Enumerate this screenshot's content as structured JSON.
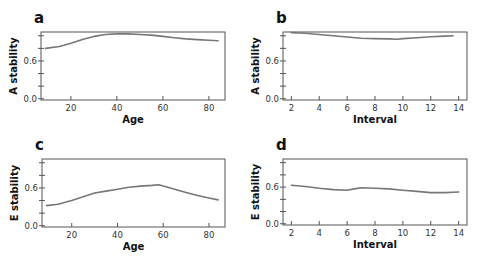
{
  "chart_data": [
    {
      "id": "a",
      "type": "line",
      "panel_label": "a",
      "title": "",
      "xlabel": "Age",
      "ylabel": "A stability",
      "xlim": [
        7,
        87
      ],
      "ylim": [
        -0.02,
        1.06
      ],
      "xticks": [
        20,
        40,
        60,
        80
      ],
      "xtick_labels": [
        "20",
        "40",
        "60",
        "80"
      ],
      "yticks": [
        0.0,
        0.2,
        0.4,
        0.6,
        0.8,
        1.0
      ],
      "ytick_labels": [
        "0.0",
        "",
        "",
        "0.6",
        "",
        ""
      ],
      "grid": false,
      "series": [
        {
          "name": "A stability by age",
          "x": [
            9,
            15,
            20,
            25,
            30,
            35,
            40,
            45,
            50,
            55,
            60,
            65,
            70,
            75,
            80,
            84
          ],
          "y": [
            0.8,
            0.83,
            0.88,
            0.94,
            0.99,
            1.02,
            1.03,
            1.03,
            1.02,
            1.01,
            0.99,
            0.97,
            0.95,
            0.94,
            0.93,
            0.92
          ]
        }
      ]
    },
    {
      "id": "b",
      "type": "line",
      "panel_label": "b",
      "title": "",
      "xlabel": "Interval",
      "ylabel": "A stability",
      "xlim": [
        1.4,
        14.6
      ],
      "ylim": [
        -0.02,
        1.06
      ],
      "xticks": [
        2,
        4,
        6,
        8,
        10,
        12,
        14
      ],
      "xtick_labels": [
        "2",
        "4",
        "6",
        "8",
        "10",
        "12",
        "14"
      ],
      "yticks": [
        0.0,
        0.2,
        0.4,
        0.6,
        0.8,
        1.0
      ],
      "ytick_labels": [
        "0.0",
        "",
        "",
        "0.6",
        "",
        ""
      ],
      "grid": false,
      "series": [
        {
          "name": "A stability by interval",
          "x": [
            2,
            3,
            4,
            5,
            6,
            7,
            8,
            9,
            9.6,
            10,
            11,
            12,
            13,
            13.6
          ],
          "y": [
            1.05,
            1.04,
            1.02,
            1.0,
            0.98,
            0.96,
            0.955,
            0.95,
            0.945,
            0.955,
            0.97,
            0.985,
            0.995,
            1.0
          ]
        }
      ]
    },
    {
      "id": "c",
      "type": "line",
      "panel_label": "c",
      "title": "",
      "xlabel": "Age",
      "ylabel": "E stability",
      "xlim": [
        7,
        87
      ],
      "ylim": [
        -0.02,
        1.06
      ],
      "xticks": [
        20,
        40,
        60,
        80
      ],
      "xtick_labels": [
        "20",
        "40",
        "60",
        "80"
      ],
      "yticks": [
        0.0,
        0.2,
        0.4,
        0.6,
        0.8,
        1.0
      ],
      "ytick_labels": [
        "0.0",
        "",
        "",
        "0.6",
        "",
        ""
      ],
      "grid": false,
      "series": [
        {
          "name": "E stability by age",
          "x": [
            9,
            14,
            20,
            25,
            30,
            35,
            40,
            45,
            50,
            55,
            58,
            65,
            70,
            75,
            80,
            84
          ],
          "y": [
            0.32,
            0.34,
            0.4,
            0.46,
            0.52,
            0.55,
            0.58,
            0.61,
            0.63,
            0.64,
            0.65,
            0.58,
            0.53,
            0.48,
            0.44,
            0.41
          ]
        }
      ]
    },
    {
      "id": "d",
      "type": "line",
      "panel_label": "d",
      "title": "",
      "xlabel": "Interval",
      "ylabel": "E stability",
      "xlim": [
        1.4,
        14.6
      ],
      "ylim": [
        -0.02,
        1.06
      ],
      "xticks": [
        2,
        4,
        6,
        8,
        10,
        12,
        14
      ],
      "xtick_labels": [
        "2",
        "4",
        "6",
        "8",
        "10",
        "12",
        "14"
      ],
      "yticks": [
        0.0,
        0.2,
        0.4,
        0.6,
        0.8,
        1.0
      ],
      "ytick_labels": [
        "0.0",
        "",
        "",
        "0.6",
        "",
        ""
      ],
      "grid": false,
      "series": [
        {
          "name": "E stability by interval",
          "x": [
            2,
            3,
            4,
            5,
            6,
            6.5,
            7,
            8,
            9,
            10,
            11,
            12,
            12.5,
            13,
            14
          ],
          "y": [
            0.63,
            0.61,
            0.58,
            0.56,
            0.55,
            0.57,
            0.59,
            0.58,
            0.57,
            0.55,
            0.53,
            0.51,
            0.51,
            0.51,
            0.52
          ]
        }
      ]
    }
  ]
}
